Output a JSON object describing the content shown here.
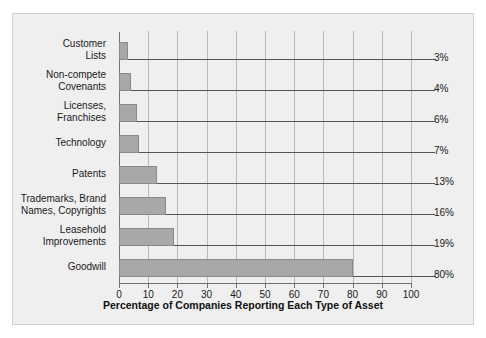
{
  "chart_data": {
    "type": "bar",
    "orientation": "horizontal",
    "title": "",
    "xlabel": "Percentage of Companies Reporting Each Type of Asset",
    "ylabel": "",
    "categories": [
      "Customer\nLists",
      "Non-compete\nCovenants",
      "Licenses,\nFranchises",
      "Technology",
      "Patents",
      "Trademarks, Brand\nNames, Copyrights",
      "Leasehold\nImprovements",
      "Goodwill"
    ],
    "values": [
      3,
      4,
      6,
      7,
      13,
      16,
      19,
      80
    ],
    "value_labels": [
      "3%",
      "4%",
      "6%",
      "7%",
      "13%",
      "16%",
      "19%",
      "80%"
    ],
    "xlim": [
      0,
      100
    ],
    "xticks": [
      0,
      10,
      20,
      30,
      40,
      50,
      60,
      70,
      80,
      90,
      100
    ],
    "xtick_labels": [
      "0",
      "10",
      "20",
      "30",
      "40",
      "50",
      "60",
      "70",
      "80",
      "90",
      "100"
    ],
    "grid": true,
    "grid_axis": "x",
    "legend": false,
    "bar_color": "#a8a8a8",
    "bar_edge_color": "#8a8a8a",
    "background_color": "#efefef",
    "axis_color": "#6f6f6f",
    "gridline_color": "#b9b9b9",
    "text_color": "#1a1a1a"
  }
}
